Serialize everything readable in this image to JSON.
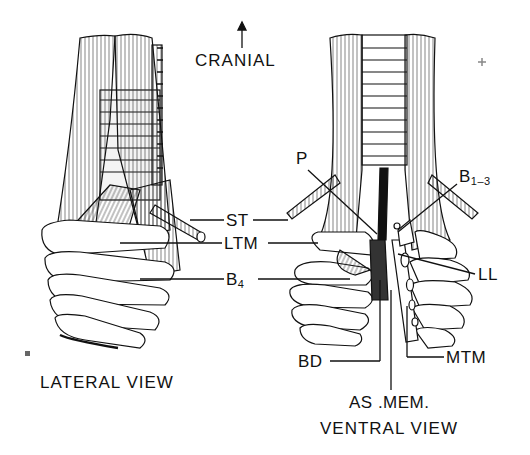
{
  "figure": {
    "orientation": {
      "arrow": "up-arrow",
      "label": "CRANIAL"
    },
    "views": [
      {
        "id": "lateral",
        "title": "LATERAL VIEW"
      },
      {
        "id": "ventral",
        "title": "VENTRAL VIEW"
      }
    ],
    "labels": {
      "ST": "ST",
      "LTM": "LTM",
      "B4_main": "B",
      "B4_sub": "4",
      "P": "P",
      "B13_main": "B",
      "B13_sub": "1–3",
      "LL": "LL",
      "BD": "BD",
      "MTM": "MTM",
      "ASMEM": "AS .MEM."
    },
    "colors": {
      "ink": "#111111",
      "background": "#ffffff",
      "shade": "#d8d8d8"
    }
  }
}
